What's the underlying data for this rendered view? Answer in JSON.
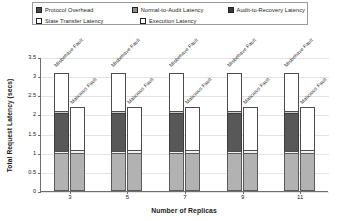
{
  "chart_data": {
    "type": "bar",
    "title": "",
    "xlabel": "Number of Replicas",
    "ylabel": "Total Request Latency (secs)",
    "ylim": [
      0,
      3.5
    ],
    "yticks": [
      "0",
      "0.5",
      "1",
      "1.5",
      "2",
      "2.5",
      "3",
      "3.5"
    ],
    "grid": true,
    "legend_position": "top",
    "categories": [
      "3",
      "5",
      "7",
      "9",
      "11"
    ],
    "bar_labels": [
      "Misbehave Fault",
      "Malicious Fault"
    ],
    "stack_order": [
      "Execution Latency",
      "Audit-to-Recovery Latency",
      "Protocol Overhead",
      "Normal-to-Audit Latency",
      "State Transfer Latency"
    ],
    "series": [
      {
        "name": "Execution Latency",
        "swatch": "exec-swatch",
        "color": "#b2b2b2",
        "values": [
          {
            "category": "3",
            "misbehave": 1.0,
            "malicious": 1.0
          },
          {
            "category": "5",
            "misbehave": 1.0,
            "malicious": 1.0
          },
          {
            "category": "7",
            "misbehave": 1.0,
            "malicious": 1.0
          },
          {
            "category": "9",
            "misbehave": 1.0,
            "malicious": 1.0
          },
          {
            "category": "11",
            "misbehave": 1.0,
            "malicious": 1.0
          }
        ]
      },
      {
        "name": "Audit-to-Recovery Latency",
        "swatch": "audit-swatch",
        "color": "#f2f2f2",
        "values": [
          {
            "category": "3",
            "misbehave": 0.06,
            "malicious": 0.09
          },
          {
            "category": "5",
            "misbehave": 0.06,
            "malicious": 0.09
          },
          {
            "category": "7",
            "misbehave": 0.06,
            "malicious": 0.1
          },
          {
            "category": "9",
            "misbehave": 0.06,
            "malicious": 0.09
          },
          {
            "category": "11",
            "misbehave": 0.06,
            "malicious": 0.1
          }
        ]
      },
      {
        "name": "Protocol Overhead",
        "swatch": "protocol-swatch",
        "color": "#585858",
        "values": [
          {
            "category": "3",
            "misbehave": 1.02,
            "malicious": 0.0
          },
          {
            "category": "5",
            "misbehave": 1.02,
            "malicious": 0.0
          },
          {
            "category": "7",
            "misbehave": 1.02,
            "malicious": 0.0
          },
          {
            "category": "9",
            "misbehave": 1.02,
            "malicious": 0.0
          },
          {
            "category": "11",
            "misbehave": 1.04,
            "malicious": 0.0
          }
        ]
      },
      {
        "name": "Normal-to-Audit Latency",
        "swatch": "normal-swatch",
        "color": "#cfcfcf",
        "values": [
          {
            "category": "3",
            "misbehave": 0.08,
            "malicious": 0.0
          },
          {
            "category": "5",
            "misbehave": 0.08,
            "malicious": 0.0
          },
          {
            "category": "7",
            "misbehave": 0.08,
            "malicious": 0.0
          },
          {
            "category": "9",
            "misbehave": 0.08,
            "malicious": 0.0
          },
          {
            "category": "11",
            "misbehave": 0.08,
            "malicious": 0.0
          }
        ]
      },
      {
        "name": "State Transfer Latency",
        "swatch": "state-swatch",
        "color": "#ffffff",
        "values": [
          {
            "category": "3",
            "misbehave": 1.04,
            "malicious": 1.16
          },
          {
            "category": "5",
            "misbehave": 1.04,
            "malicious": 1.16
          },
          {
            "category": "7",
            "misbehave": 1.04,
            "malicious": 1.15
          },
          {
            "category": "9",
            "misbehave": 1.04,
            "malicious": 1.16
          },
          {
            "category": "11",
            "misbehave": 1.02,
            "malicious": 1.15
          }
        ]
      }
    ],
    "totals": {
      "misbehave": [
        3.2,
        3.2,
        3.2,
        3.2,
        3.2
      ],
      "malicious": [
        2.25,
        2.25,
        2.25,
        2.25,
        2.25
      ]
    }
  },
  "legend": {
    "items": [
      {
        "label": "Protocol Overhead",
        "swatch": "protocol"
      },
      {
        "label": "Normal-to-Audit Latency",
        "swatch": "normal"
      },
      {
        "label": "Audit-to-Recovery Latency",
        "swatch": "audit"
      },
      {
        "label": "State Transfer Latency",
        "swatch": "state"
      },
      {
        "label": "Execution Latency",
        "swatch": "exec"
      }
    ]
  }
}
